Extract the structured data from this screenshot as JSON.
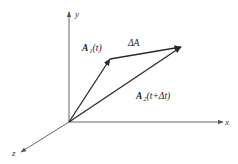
{
  "diagram": {
    "type": "vector-diagram",
    "axes": {
      "x_label": "x",
      "y_label": "y",
      "z_label": "z"
    },
    "vectors": [
      {
        "id": "A1",
        "name": "A",
        "subscript": "1",
        "arg": "(t)",
        "from": "origin",
        "to": "P1"
      },
      {
        "id": "A2",
        "name": "A",
        "subscript": "2",
        "arg": "(t+Δt)",
        "from": "origin",
        "to": "P2"
      },
      {
        "id": "dA",
        "name": "ΔA",
        "subscript": "",
        "arg": "",
        "from": "P1",
        "to": "P2"
      }
    ],
    "labels": {
      "a1_name": "A",
      "a1_sub": "1",
      "a1_arg": "(t)",
      "da": "ΔA",
      "a2_name": "A",
      "a2_sub": "2",
      "a2_arg": "(t+Δt)"
    },
    "colors": {
      "axis": "#555555",
      "vector": "#2a2a2a",
      "text": "#333333"
    }
  }
}
